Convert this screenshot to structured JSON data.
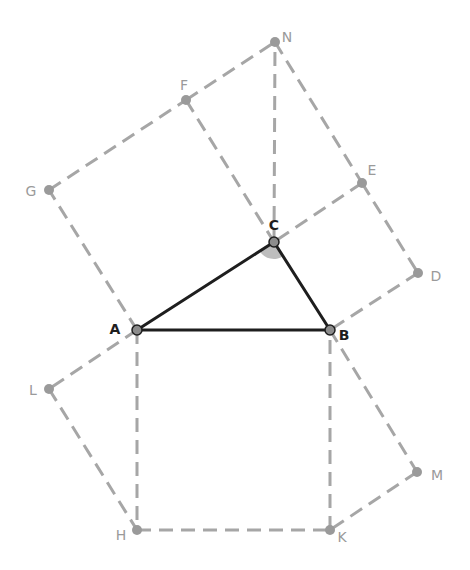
{
  "colors": {
    "triangle": "#1e1e1e",
    "construction": "#a6a6a6",
    "point_main": "#8c8c8c",
    "point_aux": "#9a9a9a",
    "label_main": "#1e1e1e",
    "label_aux": "#9a9a9a",
    "angle_fill": "#bdbdbd"
  },
  "points": {
    "A": {
      "x": 137,
      "y": 330,
      "label": "A",
      "main": true
    },
    "B": {
      "x": 330,
      "y": 330,
      "label": "B",
      "main": true
    },
    "C": {
      "x": 274,
      "y": 242,
      "label": "C",
      "main": true
    },
    "N": {
      "x": 275,
      "y": 42,
      "label": "N",
      "main": false
    },
    "F": {
      "x": 186,
      "y": 100,
      "label": "F",
      "main": false
    },
    "G": {
      "x": 49,
      "y": 190,
      "label": "G",
      "main": false
    },
    "E": {
      "x": 362,
      "y": 183,
      "label": "E",
      "main": false
    },
    "D": {
      "x": 418,
      "y": 273,
      "label": "D",
      "main": false
    },
    "L": {
      "x": 49,
      "y": 389,
      "label": "L",
      "main": false
    },
    "H": {
      "x": 137,
      "y": 530,
      "label": "H",
      "main": false
    },
    "K": {
      "x": 330,
      "y": 530,
      "label": "K",
      "main": false
    },
    "M": {
      "x": 417,
      "y": 472,
      "label": "M",
      "main": false
    }
  },
  "triangle": [
    "A",
    "B",
    "C"
  ],
  "dashed_segments": [
    [
      "A",
      "G"
    ],
    [
      "G",
      "F"
    ],
    [
      "F",
      "C"
    ],
    [
      "F",
      "N"
    ],
    [
      "C",
      "N"
    ],
    [
      "N",
      "E"
    ],
    [
      "E",
      "C"
    ],
    [
      "E",
      "D"
    ],
    [
      "D",
      "B"
    ],
    [
      "A",
      "H"
    ],
    [
      "H",
      "K"
    ],
    [
      "K",
      "B"
    ],
    [
      "A",
      "L"
    ],
    [
      "L",
      "H"
    ],
    [
      "B",
      "M"
    ],
    [
      "M",
      "K"
    ]
  ],
  "angle_marker": {
    "vertex": "C",
    "from": "A",
    "to": "B",
    "radius": 17
  },
  "label_offsets": {
    "A": [
      -22,
      0
    ],
    "B": [
      14,
      6
    ],
    "C": [
      0,
      -16
    ],
    "N": [
      12,
      -4
    ],
    "F": [
      -2,
      -14
    ],
    "G": [
      -18,
      2
    ],
    "E": [
      10,
      -12
    ],
    "D": [
      18,
      4
    ],
    "L": [
      -16,
      2
    ],
    "H": [
      -16,
      6
    ],
    "K": [
      12,
      8
    ],
    "M": [
      20,
      4
    ]
  }
}
